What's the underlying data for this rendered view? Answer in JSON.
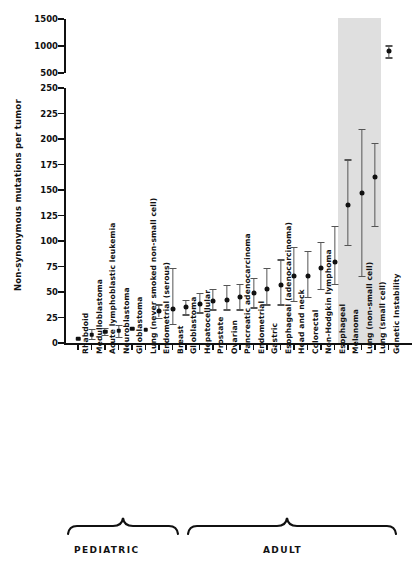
{
  "chart_data": {
    "type": "scatter",
    "title": "",
    "xlabel": "",
    "ylabel": "Non-synonymous mutations per tumor",
    "axis_break": true,
    "lower_axis": {
      "ylim": [
        0,
        250
      ],
      "ticks": [
        0,
        25,
        50,
        75,
        100,
        125,
        150,
        175,
        200,
        225,
        250
      ]
    },
    "upper_axis": {
      "ylim": [
        500,
        1500
      ],
      "ticks": [
        500,
        1000,
        1500
      ]
    },
    "grid": false,
    "legend": null,
    "categories": [
      "Rhabdoid",
      "Medulloblastoma",
      "Acute lymphoblastic leukemia",
      "Neuroblastoma",
      "Glioblastoma",
      "Lung (never smoked non-small cell)",
      "Endometrial (serous)",
      "Breast",
      "Glioblastoma",
      "Hepatocellular",
      "Prostate",
      "Ovarian",
      "Pancreatic adenocarcinoma",
      "Endometrial",
      "Gastric",
      "Esophageal (adenocarcinoma)",
      "Head and neck",
      "Colorectal",
      "Non-Hodgkin lymphoma",
      "Esophageal",
      "Melanoma",
      "Lung (non-small cell)",
      "Lung (small cell)",
      "Genetic Instability"
    ],
    "values": [
      4,
      8,
      11,
      12,
      14,
      13,
      31,
      33,
      35,
      38,
      41,
      42,
      45,
      49,
      53,
      57,
      66,
      66,
      74,
      79,
      135,
      147,
      163,
      900
    ],
    "err_low": [
      4,
      4,
      8,
      6,
      14,
      13,
      25,
      19,
      28,
      30,
      33,
      33,
      33,
      35,
      38,
      38,
      41,
      45,
      53,
      58,
      96,
      66,
      115,
      790
    ],
    "err_high": [
      4,
      14,
      15,
      18,
      14,
      13,
      38,
      74,
      42,
      49,
      53,
      57,
      58,
      64,
      74,
      82,
      94,
      90,
      99,
      115,
      180,
      210,
      196,
      1010
    ],
    "groups": [
      {
        "label": "PEDIATRIC",
        "from": 0,
        "to": 4
      },
      {
        "label": "ADULT",
        "from": 6,
        "to": 22
      }
    ],
    "highlight_band": {
      "from": "Melanoma",
      "to": "Lung (small cell)",
      "color": "#d9d9d9"
    }
  },
  "axis": {
    "ylabel": "Non-synonymous mutations per tumor",
    "upper_ticks": [
      "1500",
      "1000",
      "500"
    ],
    "lower_ticks": [
      "250",
      "225",
      "200",
      "175",
      "150",
      "125",
      "100",
      "75",
      "50",
      "25",
      "0"
    ]
  },
  "brackets": {
    "pediatric": "PEDIATRIC",
    "adult": "ADULT"
  }
}
